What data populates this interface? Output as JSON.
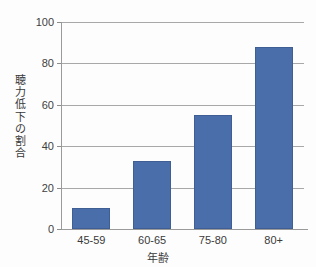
{
  "chart_data": {
    "type": "bar",
    "title": "",
    "subtitle": "",
    "xlabel": "年齢",
    "ylabel": "聴力低下の割合",
    "categories": [
      "45-59",
      "60-65",
      "75-80",
      "80+"
    ],
    "values": [
      10,
      33,
      55,
      88
    ],
    "series": [
      {
        "name": "聴力低下の割合",
        "values": [
          10,
          33,
          55,
          88
        ]
      }
    ],
    "ylim": [
      0,
      100
    ],
    "ytick_labels": [
      "0",
      "20",
      "40",
      "60",
      "80",
      "100"
    ],
    "ytick_values": [
      0,
      20,
      40,
      60,
      80,
      100
    ],
    "grid": true,
    "grid_axis": "y",
    "legend": false,
    "legend_position": "none",
    "bar_color": "#4a6ea9",
    "bar_edge_color": "#3f5f94",
    "axis_color": "#9a9a9a",
    "grid_color": "#a8a8a8",
    "background_color": "#fdfdfd",
    "annotations": []
  },
  "y_axis_title_chars": [
    "聴",
    "力",
    "低",
    "下",
    "の",
    "割",
    "合"
  ]
}
